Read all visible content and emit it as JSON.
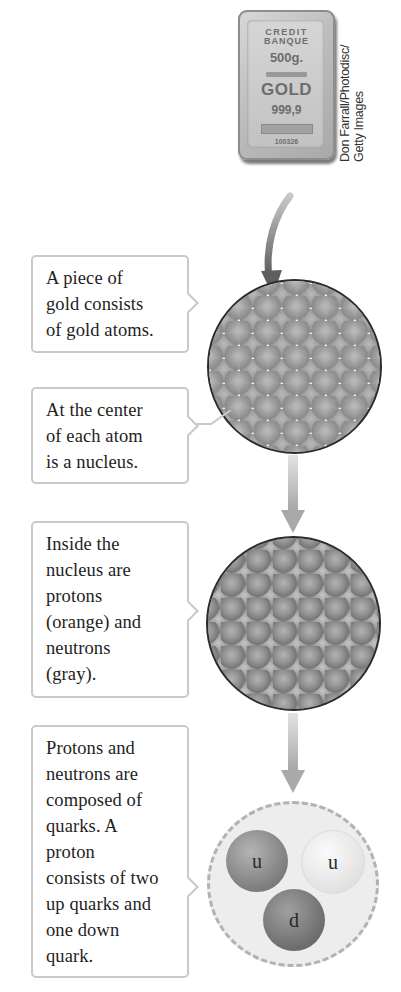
{
  "photo": {
    "gold_bar": {
      "line1": "CREDIT",
      "line2": "BANQUE",
      "weight": "500g.",
      "metal": "GOLD",
      "purity": "999,9",
      "serial": "100326"
    },
    "credit_line1": "Don Farrall/Photodisc/",
    "credit_line2": "Getty Images"
  },
  "callouts": [
    {
      "text": "A piece of gold consists of gold atoms."
    },
    {
      "text": "At the center of each atom is a nucleus."
    },
    {
      "text": "Inside the nucleus are protons (orange) and neutrons (gray)."
    },
    {
      "text": "Protons and neutrons are composed of quarks. A proton consists of two up quarks and one down quark."
    }
  ],
  "callout_lines": [
    [
      "A piece of",
      "gold consists",
      "of gold atoms."
    ],
    [
      "At the center",
      "of each atom",
      "is a nucleus."
    ],
    [
      "Inside the",
      "nucleus are",
      "protons",
      "(orange) and",
      "neutrons",
      "(gray)."
    ],
    [
      "Protons and",
      "neutrons are",
      "composed of",
      "quarks. A",
      "proton",
      "consists of two",
      "up quarks and",
      "one down",
      "quark."
    ]
  ],
  "proton": {
    "quarks": [
      {
        "label": "u",
        "type": "up"
      },
      {
        "label": "u",
        "type": "up"
      },
      {
        "label": "d",
        "type": "down"
      }
    ]
  },
  "colors": {
    "box_border": "#c9c9c9",
    "circle_outline": "#2b2b2b",
    "arrow": "#8a8a8a",
    "atom_fill": "#9c9c9c",
    "nucleus_fill": "#8f8f8f",
    "proton_fill": "#ececec"
  }
}
